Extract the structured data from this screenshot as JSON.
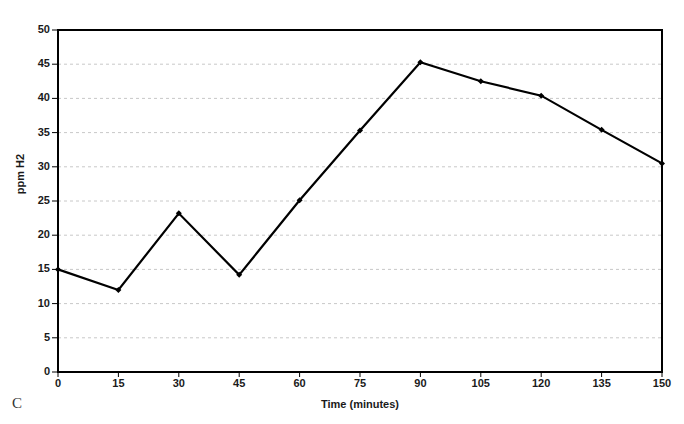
{
  "chart_data": {
    "type": "line",
    "title": "",
    "panel_label": "C",
    "xlabel": "Time (minutes)",
    "ylabel": "ppm H2",
    "x": [
      0,
      15,
      30,
      45,
      60,
      75,
      90,
      105,
      120,
      135,
      150
    ],
    "values": [
      15.0,
      12.0,
      23.2,
      14.2,
      25.1,
      35.3,
      45.3,
      42.5,
      40.4,
      35.4,
      30.5
    ],
    "series": [
      {
        "name": "ppm H2",
        "values": [
          15.0,
          12.0,
          23.2,
          14.2,
          25.1,
          35.3,
          45.3,
          42.5,
          40.4,
          35.4,
          30.5
        ]
      }
    ],
    "xlim": [
      0,
      150
    ],
    "ylim": [
      0,
      50
    ],
    "xticks": [
      0,
      15,
      30,
      45,
      60,
      75,
      90,
      105,
      120,
      135,
      150
    ],
    "yticks": [
      0,
      5,
      10,
      15,
      20,
      25,
      30,
      35,
      40,
      45,
      50
    ],
    "xtick_labels": [
      "0",
      "15",
      "30",
      "45",
      "60",
      "75",
      "90",
      "105",
      "120",
      "135",
      "150"
    ],
    "ytick_labels": [
      "0",
      "5",
      "10",
      "15",
      "20",
      "25",
      "30",
      "35",
      "40",
      "45",
      "50"
    ],
    "grid": {
      "horizontal": true,
      "vertical": false,
      "style": "dashed",
      "color": "#c8c8c8"
    },
    "legend": {
      "visible": false,
      "position": "none"
    },
    "line_color": "#000000",
    "marker": "diamond",
    "marker_color": "#000000",
    "plot_border": true,
    "background_color": "#ffffff"
  }
}
